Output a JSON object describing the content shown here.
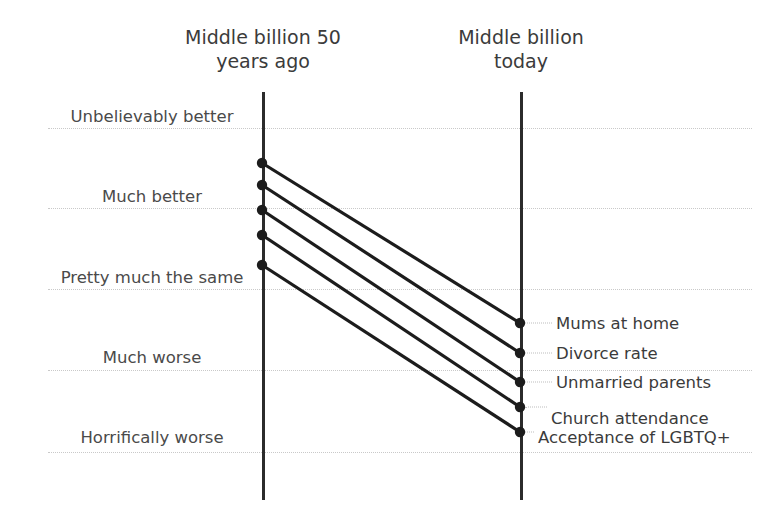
{
  "chart_data": {
    "type": "line",
    "subtype": "slopegraph",
    "title": "",
    "categories": [
      "Middle billion 50 years ago",
      "Middle billion today"
    ],
    "axis_headers": [
      {
        "id": "left",
        "label": "Middle billion 50\nyears ago"
      },
      {
        "id": "right",
        "label": "Middle billion\ntoday"
      }
    ],
    "y_scale": {
      "type": "ordinal",
      "levels": [
        "Unbelievably better",
        "Much better",
        "Pretty much the same",
        "Much worse",
        "Horrifically worse"
      ],
      "direction": "better-to-worse",
      "gridlines": true
    },
    "series": [
      {
        "name": "Mums at home",
        "left": "Unbelievably better / Much better",
        "right": "Pretty much the same / Much worse"
      },
      {
        "name": "Divorce rate",
        "left": "Much better",
        "right": "Much worse"
      },
      {
        "name": "Unmarried parents",
        "left": "Much better",
        "right": "Much worse"
      },
      {
        "name": "Church attendance",
        "left": "Much better / Pretty much the same",
        "right": "Much worse / Horrifically worse"
      },
      {
        "name": "Acceptance of LGBTQ+",
        "left": "Pretty much the same",
        "right": "Horrifically worse"
      }
    ],
    "legend": "none",
    "xlabel": "",
    "ylabel": ""
  },
  "scale_labels": [
    {
      "text": "Unbelievably better",
      "y": 126,
      "x": 152
    },
    {
      "text": "Much better",
      "y": 206,
      "x": 152
    },
    {
      "text": "Pretty much the same",
      "y": 287,
      "x": 152
    },
    {
      "text": "Much worse",
      "y": 367,
      "x": 152
    },
    {
      "text": "Horrifically worse",
      "y": 447,
      "x": 152
    }
  ],
  "gridlines": [
    {
      "y": 128
    },
    {
      "y": 208
    },
    {
      "y": 289
    },
    {
      "y": 370
    },
    {
      "y": 452
    }
  ],
  "slopes": [
    {
      "name": "Mums at home",
      "x1": 262,
      "y1": 163,
      "x2": 520,
      "y2": 323
    },
    {
      "name": "Divorce rate",
      "x1": 262,
      "y1": 185,
      "x2": 520,
      "y2": 353
    },
    {
      "name": "Unmarried parents",
      "x1": 262,
      "y1": 210,
      "x2": 520,
      "y2": 382
    },
    {
      "name": "Church attendance",
      "x1": 262,
      "y1": 235,
      "x2": 520,
      "y2": 407
    },
    {
      "name": "Acceptance of LGBTQ+",
      "x1": 262,
      "y1": 265,
      "x2": 520,
      "y2": 432
    }
  ],
  "series_labels": [
    {
      "text": "Mums at home",
      "x": 556,
      "y": 323
    },
    {
      "text": "Divorce rate",
      "x": 556,
      "y": 353
    },
    {
      "text": "Unmarried parents",
      "x": 556,
      "y": 382
    },
    {
      "text": "Church attendance",
      "x": 551,
      "y": 418
    },
    {
      "text": "Acceptance of LGBTQ+",
      "x": 538,
      "y": 437
    }
  ],
  "colors": {
    "line": "#1c1c1c",
    "axis": "#2b2b2b",
    "grid": "#c9c9c9",
    "text": "#3b3b3b",
    "background": "#ffffff"
  }
}
